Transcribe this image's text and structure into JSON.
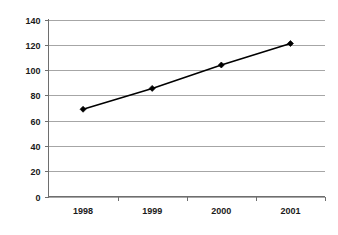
{
  "chart_data": {
    "type": "line",
    "title": "",
    "subtitle": "",
    "xlabel": "",
    "ylabel": "",
    "categories": [
      "1998",
      "1999",
      "2000",
      "2001"
    ],
    "values": [
      69,
      85.5,
      104,
      121
    ],
    "series": [
      {
        "name": "",
        "values": [
          69,
          85.5,
          104,
          121
        ],
        "color": "#000000",
        "marker": "diamond",
        "line_style": "solid"
      }
    ],
    "ylim": [
      0,
      140
    ],
    "yticks": [
      0,
      20,
      40,
      60,
      80,
      100,
      120,
      140
    ],
    "ytick_labels": [
      "0",
      "20",
      "40",
      "60",
      "80",
      "100",
      "120",
      "140"
    ],
    "xtick_labels": [
      "1998",
      "1999",
      "2000",
      "2001"
    ],
    "grid": {
      "horizontal": true,
      "vertical": false,
      "color": "#a6a6a6"
    },
    "legend": {
      "visible": false,
      "position": "none",
      "entries": []
    },
    "axis_color": "#6e6e6e",
    "label_color": "#1a1a1a",
    "background": "#ffffff",
    "annotations": []
  }
}
